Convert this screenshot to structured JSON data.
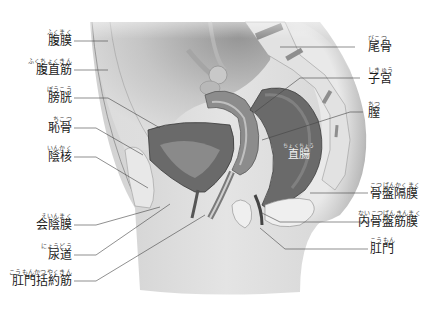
{
  "figure": {
    "palette": {
      "background": "#ffffff",
      "skin": "#d8d8d8",
      "skin_dark": "#a9a9a9",
      "organ": "#6e6e6e",
      "organ_dark": "#4a4a4a",
      "bone": "#e6e6e6",
      "leader_line": "#444444",
      "text": "#1a1a1a"
    }
  },
  "labels_left": [
    {
      "id": "peritoneum",
      "ruby": "ふくまく",
      "kanji": "腹膜"
    },
    {
      "id": "rectus-abdominis",
      "ruby": "ふくちょくきん",
      "kanji": "腹直筋"
    },
    {
      "id": "bladder",
      "ruby": "ぼうこう",
      "kanji": "膀胱"
    },
    {
      "id": "pubic-bone",
      "ruby": "ちこつ",
      "kanji": "恥骨"
    },
    {
      "id": "clitoris",
      "ruby": "いんかく",
      "kanji": "陰核"
    },
    {
      "id": "perineal-membrane",
      "ruby": "えいんまく",
      "kanji": "会陰膜"
    },
    {
      "id": "urethra",
      "ruby": "にょうどう",
      "kanji": "尿道"
    },
    {
      "id": "anal-sphincter",
      "ruby": "こうもんかつやくきん",
      "kanji": "肛門括約筋"
    }
  ],
  "labels_right": [
    {
      "id": "coccyx",
      "ruby": "びこつ",
      "kanji": "尾骨"
    },
    {
      "id": "uterus",
      "ruby": "しきゅう",
      "kanji": "子宮"
    },
    {
      "id": "vagina",
      "ruby": "ちつ",
      "kanji": "膣"
    },
    {
      "id": "pelvic-diaphragm",
      "ruby": "こつばんかくまく",
      "kanji": "骨盤隔膜"
    },
    {
      "id": "endopelvic-fascia",
      "ruby": "ないこつばんきんまく",
      "kanji": "内骨盤筋膜"
    },
    {
      "id": "anus",
      "ruby": "こうもん",
      "kanji": "肛門"
    }
  ],
  "labels_inner": [
    {
      "id": "rectum",
      "ruby": "ちょくちょう",
      "kanji": "直腸"
    }
  ]
}
